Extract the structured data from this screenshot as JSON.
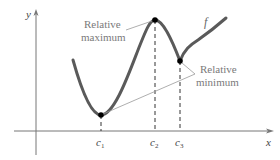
{
  "diagram": {
    "type": "function-extrema",
    "axes": {
      "x_label": "x",
      "y_label": "y"
    },
    "function_label": "f",
    "critical_points": [
      {
        "id": "c1",
        "label": "c",
        "subscript": "1",
        "kind": "relative minimum"
      },
      {
        "id": "c2",
        "label": "c",
        "subscript": "2",
        "kind": "relative maximum"
      },
      {
        "id": "c3",
        "label": "c",
        "subscript": "3",
        "kind": "relative minimum"
      }
    ],
    "annotations": {
      "max_line1": "Relative",
      "max_line2": "maximum",
      "min_line1": "Relative",
      "min_line2": "minimum"
    },
    "colors": {
      "curve": "#5a5a5a",
      "axis": "#666666",
      "annotation_text": "#7a7a7a",
      "point": "#000000"
    }
  }
}
